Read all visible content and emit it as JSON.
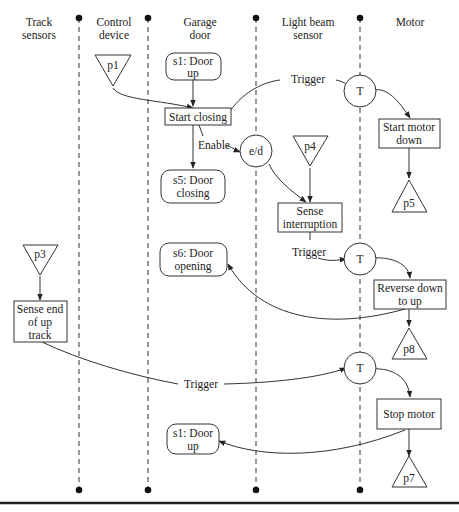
{
  "lanes": [
    {
      "id": "track",
      "label_line1": "Track",
      "label_line2": "sensors"
    },
    {
      "id": "control",
      "label_line1": "Control",
      "label_line2": "device"
    },
    {
      "id": "garage",
      "label_line1": "Garage",
      "label_line2": "door"
    },
    {
      "id": "lightbeam",
      "label_line1": "Light beam",
      "label_line2": "sensor"
    },
    {
      "id": "motor",
      "label_line1": "Motor",
      "label_line2": ""
    }
  ],
  "nodes": {
    "p1": {
      "type": "inverted-triangle",
      "label": "p1"
    },
    "p3": {
      "type": "inverted-triangle",
      "label": "p3"
    },
    "p4": {
      "type": "inverted-triangle",
      "label": "p4"
    },
    "p5": {
      "type": "triangle",
      "label": "p5"
    },
    "p7": {
      "type": "triangle",
      "label": "p7"
    },
    "p8": {
      "type": "triangle",
      "label": "p8"
    },
    "s1_top": {
      "type": "state",
      "line1": "s1: Door",
      "line2": "up"
    },
    "s5": {
      "type": "state",
      "line1": "s5: Door",
      "line2": "closing"
    },
    "s6": {
      "type": "state",
      "line1": "s6: Door",
      "line2": "opening"
    },
    "s1_bottom": {
      "type": "state",
      "line1": "s1: Door",
      "line2": "up"
    },
    "start_closing": {
      "type": "activity",
      "line1": "Start closing"
    },
    "start_motor_down": {
      "type": "activity",
      "line1": "Start motor",
      "line2": "down"
    },
    "sense_interruption": {
      "type": "activity",
      "line1": "Sense",
      "line2": "interruption"
    },
    "reverse_down_up": {
      "type": "activity",
      "line1": "Reverse down",
      "line2": "to up"
    },
    "sense_end_up_track": {
      "type": "activity",
      "line1": "Sense end",
      "line2": "of up",
      "line3": "track"
    },
    "stop_motor": {
      "type": "activity",
      "line1": "Stop motor"
    },
    "ed": {
      "type": "circle",
      "label": "e/d"
    },
    "T1": {
      "type": "circle",
      "label": "T"
    },
    "T2": {
      "type": "circle",
      "label": "T"
    },
    "T3": {
      "type": "circle",
      "label": "T"
    }
  },
  "edge_labels": {
    "trigger1": "Trigger",
    "enable": "Enable",
    "trigger2": "Trigger",
    "trigger3": "Trigger"
  }
}
